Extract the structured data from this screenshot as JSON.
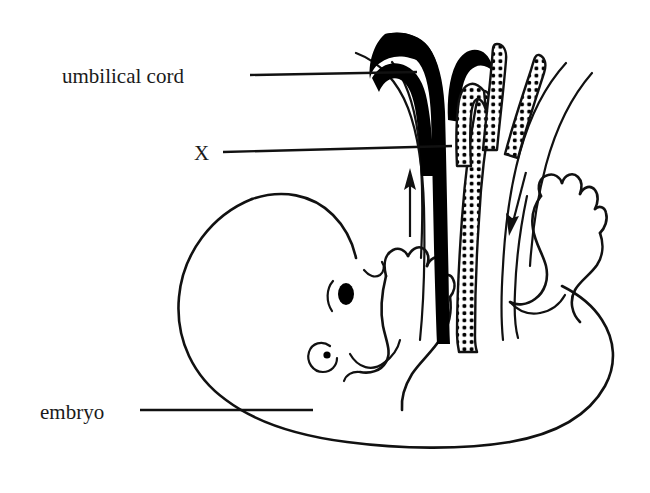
{
  "figure": {
    "title_visible": false,
    "background_color": "#ffffff",
    "ink_color": "#111111",
    "width": 650,
    "height": 493
  },
  "labels": {
    "umbilical_cord": "umbilical cord",
    "x_marker": "X",
    "embryo": "embryo"
  },
  "annotations": {
    "arrow_up_name": "blood-flow-arrow-up",
    "arrow_down_name": "blood-flow-arrow-down"
  },
  "structures": {
    "solid_vessel": "umbilical-vein-solid-black",
    "dotted_vessel": "umbilical-arteries-stippled",
    "cord_outline": "umbilical-cord-outline",
    "embryo_body": "embryo-body-outline",
    "embryo_eye": "embryo-eye",
    "embryo_ear": "embryo-ear",
    "embryo_mouth": "embryo-mouth",
    "embryo_arm": "embryo-arm-hand",
    "embryo_leg": "embryo-leg-foot"
  },
  "colors": {
    "ink": "#111111",
    "fill_solid": "#000000",
    "paper": "#ffffff"
  }
}
